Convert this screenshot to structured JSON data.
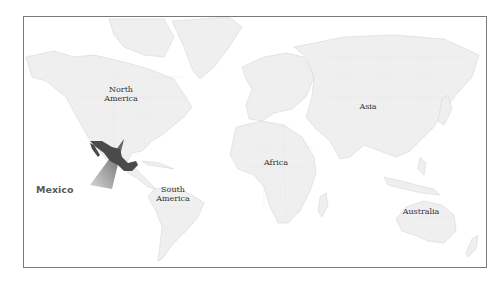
{
  "map": {
    "highlight_country": "Mexico",
    "highlight_color": "#4a4a4a",
    "land_color": "#efefef",
    "border_color": "#7a7a7a",
    "labels": {
      "north_america": [
        "North",
        "America"
      ],
      "south_america": [
        "South",
        "America"
      ],
      "africa": "Africa",
      "asia": "Asia",
      "australia": "Australia"
    },
    "callout": {
      "label": "Mexico"
    }
  }
}
